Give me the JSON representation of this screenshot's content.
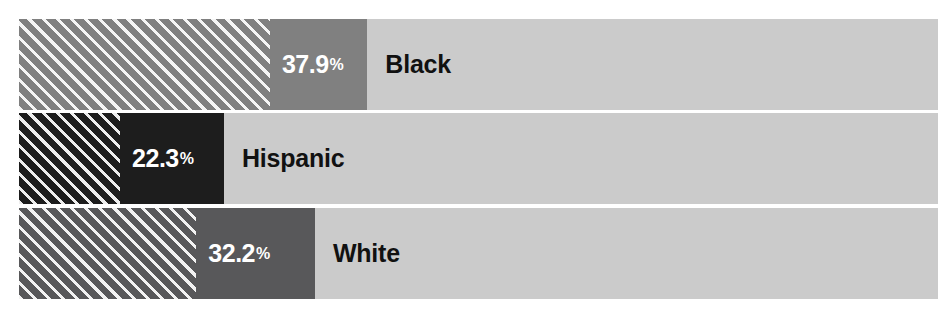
{
  "title_fragment": "",
  "chart_data": {
    "type": "bar",
    "orientation": "horizontal",
    "title": "",
    "xlabel": "",
    "ylabel": "",
    "xlim": [
      0,
      100
    ],
    "grid": false,
    "legend": "none",
    "categories": [
      "Black",
      "Hispanic",
      "White"
    ],
    "values": [
      37.9,
      22.3,
      32.2
    ],
    "value_labels": [
      "37.9",
      "22.3",
      "32.2"
    ],
    "percent_sign": "%",
    "track_color": "#cbcbcb",
    "bars": [
      {
        "category": "Black",
        "value": 37.9,
        "value_label": "37.9",
        "fill_color": "#808080",
        "hatch_fraction": 27.3,
        "hatch_pattern": "diagonal-45-white"
      },
      {
        "category": "Hispanic",
        "value": 22.3,
        "value_label": "22.3",
        "fill_color": "#1d1d1d",
        "hatch_fraction": 11.0,
        "hatch_pattern": "diagonal-45-white"
      },
      {
        "category": "White",
        "value": 32.2,
        "value_label": "32.2",
        "fill_color": "#58585a",
        "hatch_fraction": 19.3,
        "hatch_pattern": "diagonal-45-white"
      }
    ]
  }
}
